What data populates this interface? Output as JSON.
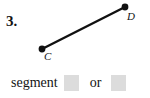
{
  "problem": {
    "number": "3."
  },
  "figure": {
    "type": "line-segment",
    "stroke_color": "#111111",
    "stroke_width": 2.4,
    "point_radius": 3.4,
    "points": [
      {
        "label": "C",
        "x": 42,
        "y": 49,
        "label_x": 44,
        "label_y": 60
      },
      {
        "label": "D",
        "x": 125,
        "y": 7,
        "label_x": 127,
        "label_y": 20
      }
    ]
  },
  "answer": {
    "prefix_word": "segment",
    "conjunction": "or",
    "blank_fill_color": "#dcdcdc",
    "blanks": [
      {
        "value": ""
      },
      {
        "value": ""
      }
    ]
  }
}
